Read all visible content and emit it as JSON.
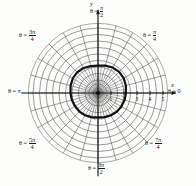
{
  "figure": {
    "kind": "polar-coordinate-grid",
    "center": {
      "x": 98,
      "y": 93
    },
    "unit_px": 13.0,
    "background": "#fdfdfc",
    "grid_color": "#5a5a5a",
    "curve_color": "#111111",
    "axis_color": "#111111"
  },
  "axis_labels": {
    "x": "x",
    "y": "y"
  },
  "angle_labels": [
    {
      "id": "theta-0",
      "text": "θ = 0",
      "deg": 0,
      "frac": null
    },
    {
      "id": "theta-pi-4",
      "text": "θ =",
      "deg": 45,
      "frac": {
        "num": "π",
        "den": "4"
      }
    },
    {
      "id": "theta-pi-2",
      "text": "θ =",
      "deg": 90,
      "frac": {
        "num": "π",
        "den": "2"
      }
    },
    {
      "id": "theta-3pi-4",
      "text": "θ =",
      "deg": 135,
      "frac": {
        "num": "3π",
        "den": "4"
      }
    },
    {
      "id": "theta-pi",
      "text": "θ = π",
      "deg": 180,
      "frac": null
    },
    {
      "id": "theta-5pi-4",
      "text": "θ =",
      "deg": 225,
      "frac": {
        "num": "5π",
        "den": "4"
      }
    },
    {
      "id": "theta-3pi-2",
      "text": "θ =",
      "deg": 270,
      "frac": {
        "num": "3π",
        "den": "2"
      }
    },
    {
      "id": "theta-7pi-4",
      "text": "θ =",
      "deg": 315,
      "frac": {
        "num": "7π",
        "den": "4"
      }
    }
  ],
  "radial_ticks": [
    {
      "label": "1",
      "r": 1
    },
    {
      "label": "2",
      "r": 2
    },
    {
      "label": "3",
      "r": 3
    },
    {
      "label": "4",
      "r": 4
    },
    {
      "label": "5",
      "r": 5
    }
  ],
  "chart_data": {
    "type": "line",
    "title": "",
    "xlabel": "x",
    "ylabel": "y",
    "coordinate_system": "polar",
    "grid": true,
    "legend": false,
    "rlim": [
      0,
      5.4
    ],
    "r_ticks": [
      1,
      2,
      3,
      4,
      5
    ],
    "theta_ticks_deg": [
      0,
      15,
      30,
      45,
      60,
      75,
      90,
      105,
      120,
      135,
      150,
      165,
      180,
      195,
      210,
      225,
      240,
      255,
      270,
      285,
      300,
      315,
      330,
      345
    ],
    "theta_tick_labels": [
      "θ = 0",
      "θ = π/4",
      "θ = π/2",
      "θ = 3π/4",
      "θ = π",
      "θ = 5π/4",
      "θ = 3π/2",
      "θ = 7π/4"
    ],
    "series": [
      {
        "name": "bold-closed-curve",
        "kind": "closed-polar-curve",
        "stroke": "#111111",
        "stroke_width_px": 2.2,
        "approx_radius": 2.1,
        "points_polar_deg_r": [
          [
            0,
            2.15
          ],
          [
            15,
            2.22
          ],
          [
            30,
            2.28
          ],
          [
            45,
            2.3
          ],
          [
            60,
            2.26
          ],
          [
            75,
            2.18
          ],
          [
            90,
            2.1
          ],
          [
            105,
            2.14
          ],
          [
            120,
            2.22
          ],
          [
            135,
            2.26
          ],
          [
            150,
            2.24
          ],
          [
            165,
            2.18
          ],
          [
            180,
            2.12
          ],
          [
            195,
            2.08
          ],
          [
            210,
            2.04
          ],
          [
            225,
            2.02
          ],
          [
            240,
            1.98
          ],
          [
            255,
            1.92
          ],
          [
            270,
            1.88
          ],
          [
            285,
            1.92
          ],
          [
            300,
            1.98
          ],
          [
            315,
            2.04
          ],
          [
            330,
            2.08
          ],
          [
            345,
            2.12
          ],
          [
            360,
            2.15
          ]
        ]
      }
    ]
  }
}
